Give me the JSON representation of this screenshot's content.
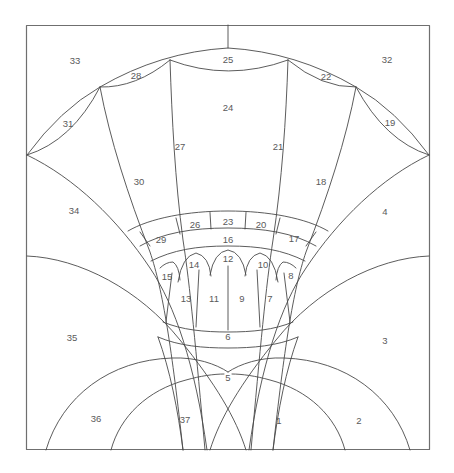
{
  "figure": {
    "type": "geometric-line-diagram",
    "background_color": "#ffffff",
    "line_color": "#4a4a4a",
    "frame_color": "#6f6f6f",
    "label_color": "#5a5a5a"
  },
  "frame": {
    "x": 26,
    "y": 25,
    "width": 404,
    "height": 425
  },
  "labels": [
    {
      "id": "1",
      "text": "1",
      "x": 279,
      "y": 421
    },
    {
      "id": "2",
      "text": "2",
      "x": 359,
      "y": 421
    },
    {
      "id": "3",
      "text": "3",
      "x": 385,
      "y": 341
    },
    {
      "id": "4",
      "text": "4",
      "x": 385,
      "y": 212
    },
    {
      "id": "5",
      "text": "5",
      "x": 228,
      "y": 378
    },
    {
      "id": "6",
      "text": "6",
      "x": 228,
      "y": 337
    },
    {
      "id": "7",
      "text": "7",
      "x": 270,
      "y": 299
    },
    {
      "id": "8",
      "text": "8",
      "x": 291,
      "y": 276
    },
    {
      "id": "9",
      "text": "9",
      "x": 242,
      "y": 299
    },
    {
      "id": "10",
      "text": "10",
      "x": 263,
      "y": 265
    },
    {
      "id": "11",
      "text": "11",
      "x": 214,
      "y": 299
    },
    {
      "id": "12",
      "text": "12",
      "x": 228,
      "y": 259
    },
    {
      "id": "13",
      "text": "13",
      "x": 186,
      "y": 299
    },
    {
      "id": "14",
      "text": "14",
      "x": 194,
      "y": 265
    },
    {
      "id": "15",
      "text": "15",
      "x": 167,
      "y": 277
    },
    {
      "id": "16",
      "text": "16",
      "x": 228,
      "y": 240
    },
    {
      "id": "17",
      "text": "17",
      "x": 294,
      "y": 239
    },
    {
      "id": "18",
      "text": "18",
      "x": 321,
      "y": 182
    },
    {
      "id": "19",
      "text": "19",
      "x": 390,
      "y": 123
    },
    {
      "id": "20",
      "text": "20",
      "x": 261,
      "y": 225
    },
    {
      "id": "21",
      "text": "21",
      "x": 278,
      "y": 147
    },
    {
      "id": "22",
      "text": "22",
      "x": 326,
      "y": 77
    },
    {
      "id": "23",
      "text": "23",
      "x": 228,
      "y": 222
    },
    {
      "id": "24",
      "text": "24",
      "x": 228,
      "y": 108
    },
    {
      "id": "25",
      "text": "25",
      "x": 228,
      "y": 60
    },
    {
      "id": "26",
      "text": "26",
      "x": 195,
      "y": 225
    },
    {
      "id": "27",
      "text": "27",
      "x": 180,
      "y": 147
    },
    {
      "id": "28",
      "text": "28",
      "x": 136,
      "y": 76
    },
    {
      "id": "29",
      "text": "29",
      "x": 161,
      "y": 240
    },
    {
      "id": "30",
      "text": "30",
      "x": 139,
      "y": 182
    },
    {
      "id": "31",
      "text": "31",
      "x": 68,
      "y": 124
    },
    {
      "id": "32",
      "text": "32",
      "x": 387,
      "y": 60
    },
    {
      "id": "33",
      "text": "33",
      "x": 75,
      "y": 61
    },
    {
      "id": "34",
      "text": "34",
      "x": 74,
      "y": 211
    },
    {
      "id": "35",
      "text": "35",
      "x": 72,
      "y": 338
    },
    {
      "id": "36",
      "text": "36",
      "x": 96,
      "y": 419
    },
    {
      "id": "37",
      "text": "37",
      "x": 185,
      "y": 420
    }
  ],
  "geometry_notes": {
    "center_x": 228,
    "apex_tick_top": 25,
    "apex_tick_bottom": 48,
    "left_spring_point": [
      27,
      155
    ],
    "right_spring_point": [
      429,
      155
    ],
    "fan_center": [
      228,
      470
    ],
    "annulus_radii": [
      242,
      259,
      276
    ],
    "label_count": 37
  }
}
